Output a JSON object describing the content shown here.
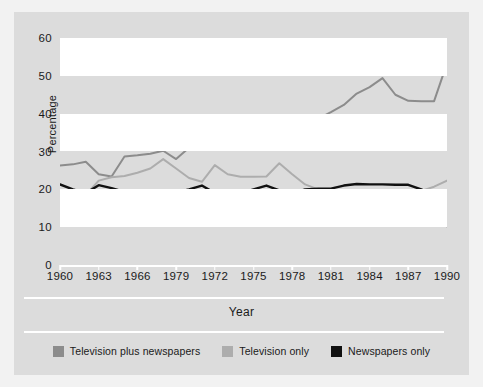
{
  "chart_data": {
    "type": "line",
    "title": "",
    "xlabel": "Year",
    "ylabel": "Percentage",
    "xlim": [
      1960,
      1990
    ],
    "ylim": [
      0,
      60
    ],
    "grid": "horizontal-banded",
    "legend_position": "bottom",
    "x_tick_labels": [
      "1960",
      "1963",
      "1966",
      "1979",
      "1972",
      "1975",
      "1978",
      "1981",
      "1984",
      "1987",
      "1990"
    ],
    "x_tick_values": [
      1960,
      1963,
      1966,
      1969,
      1972,
      1975,
      1978,
      1981,
      1984,
      1987,
      1990
    ],
    "y_tick_labels": [
      "0",
      "10",
      "20",
      "30",
      "40",
      "50",
      "60"
    ],
    "y_tick_values": [
      0,
      10,
      20,
      30,
      40,
      50,
      60
    ],
    "x": [
      1960,
      1961,
      1962,
      1963,
      1964,
      1965,
      1966,
      1967,
      1968,
      1969,
      1970,
      1971,
      1972,
      1973,
      1974,
      1975,
      1976,
      1977,
      1978,
      1979,
      1980,
      1981,
      1982,
      1983,
      1984,
      1985,
      1986,
      1987,
      1988,
      1989,
      1990
    ],
    "series": [
      {
        "name": "Television plus newspapers",
        "color": "#8c8c8c",
        "values": [
          26.3,
          26.6,
          27.3,
          24.0,
          23.4,
          28.7,
          29.0,
          29.4,
          30.2,
          28.0,
          31.0,
          33.8,
          35.6,
          36.2,
          36.2,
          36.3,
          35.0,
          33.8,
          34.0,
          36.3,
          38.6,
          40.4,
          42.3,
          45.3,
          47.0,
          49.4,
          45.0,
          43.4,
          43.3,
          43.3,
          53.3
        ]
      },
      {
        "name": "Television only",
        "color": "#adadad",
        "values": [
          19.0,
          18.9,
          18.5,
          22.3,
          23.2,
          23.5,
          24.4,
          25.5,
          28.0,
          25.5,
          23.0,
          22.0,
          26.4,
          24.0,
          23.3,
          23.3,
          23.4,
          26.9,
          24.0,
          21.3,
          20.0,
          19.9,
          18.7,
          16.0,
          14.8,
          13.0,
          15.0,
          17.2,
          19.6,
          20.7,
          22.3
        ]
      },
      {
        "name": "Newspapers only",
        "color": "#111111",
        "values": [
          21.3,
          20.0,
          19.0,
          21.1,
          20.3,
          19.3,
          18.7,
          17.9,
          18.6,
          19.2,
          20.0,
          21.0,
          19.0,
          18.9,
          18.9,
          20.0,
          21.0,
          19.7,
          18.8,
          20.0,
          20.2,
          20.2,
          21.0,
          21.4,
          21.3,
          21.3,
          21.2,
          21.2,
          20.0,
          18.2,
          10.3
        ]
      }
    ]
  },
  "figure": {
    "background": "#dcdcdc",
    "band_color": "#ffffff"
  },
  "legend": {
    "items": [
      {
        "label": "Television plus newspapers",
        "color": "#8c8c8c"
      },
      {
        "label": "Television only",
        "color": "#adadad"
      },
      {
        "label": "Newspapers only",
        "color": "#111111"
      }
    ]
  }
}
